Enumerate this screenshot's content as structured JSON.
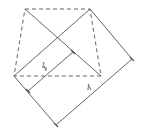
{
  "diagram": {
    "type": "geometry",
    "stroke_color": "#555555",
    "dashed_square": {
      "corners": [
        [
          25,
          9
        ],
        [
          90,
          9
        ],
        [
          101,
          76
        ],
        [
          14,
          76
        ]
      ]
    },
    "diagonals": [
      {
        "from": [
          25,
          9
        ],
        "to": [
          101,
          76
        ]
      },
      {
        "from": [
          90,
          9
        ],
        "to": [
          14,
          76
        ]
      }
    ],
    "rectangle": {
      "corners": [
        [
          90,
          9
        ],
        [
          132,
          59
        ],
        [
          56,
          125
        ],
        [
          14,
          76
        ]
      ]
    },
    "inner_segment": {
      "from": [
        28,
        91
      ],
      "to": [
        73,
        52
      ]
    },
    "ticks": [
      [
        73,
        52
      ],
      [
        132,
        59
      ],
      [
        28,
        91
      ],
      [
        56,
        125
      ]
    ],
    "labels": {
      "l1": {
        "text": "l",
        "sub": "1"
      },
      "l": {
        "text": "l"
      }
    }
  }
}
